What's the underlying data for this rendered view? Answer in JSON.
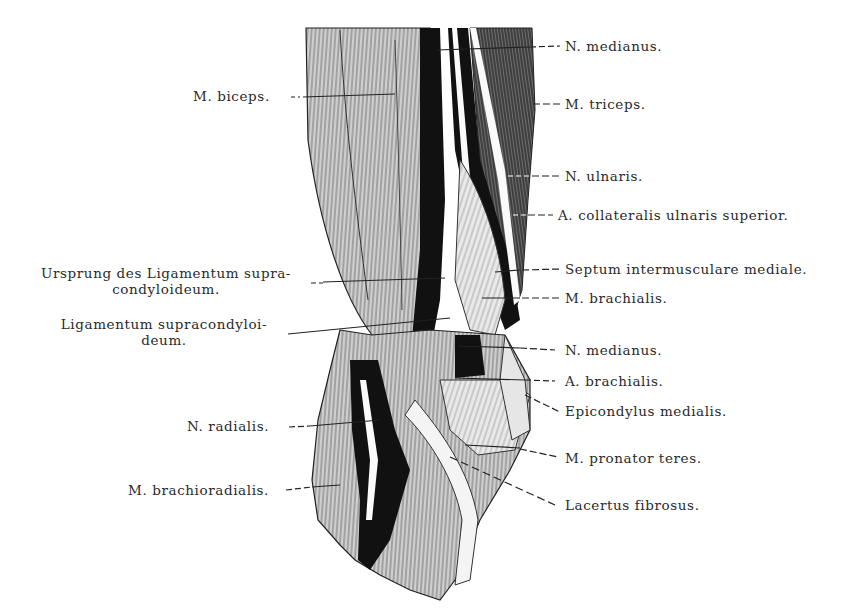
{
  "figure": {
    "colors": {
      "ink": "#111111",
      "paper": "#ffffff",
      "text": "#2a2a2a"
    }
  },
  "labels_left": [
    {
      "id": "biceps",
      "text": "M. biceps.",
      "x": 193,
      "y": 87
    },
    {
      "id": "ursprung",
      "line1": "Ursprung des Ligamentum supra-",
      "line2": "condyloideum.",
      "x": 26,
      "y": 265
    },
    {
      "id": "ligamentum",
      "line1": "Ligamentum supracondyloi-",
      "line2": "deum.",
      "x": 52,
      "y": 316
    },
    {
      "id": "radialis",
      "text": "N. radialis.",
      "x": 187,
      "y": 418
    },
    {
      "id": "brachioradialis",
      "text": "M. brachioradialis.",
      "x": 128,
      "y": 482
    }
  ],
  "labels_right": [
    {
      "id": "medianus-top",
      "text": "N. medianus.",
      "x": 565,
      "y": 37
    },
    {
      "id": "triceps",
      "text": "M. triceps.",
      "x": 565,
      "y": 96
    },
    {
      "id": "ulnaris",
      "text": "N. ulnaris.",
      "x": 565,
      "y": 167
    },
    {
      "id": "collateralis",
      "text": "A. collateralis ulnaris superior.",
      "x": 558,
      "y": 208
    },
    {
      "id": "septum",
      "text": "Septum intermusculare mediale.",
      "x": 565,
      "y": 261
    },
    {
      "id": "brachialis-m",
      "text": "M. brachialis.",
      "x": 565,
      "y": 290
    },
    {
      "id": "medianus-low",
      "text": "N. medianus.",
      "x": 565,
      "y": 343
    },
    {
      "id": "brachialis-a",
      "text": "A. brachialis.",
      "x": 565,
      "y": 374
    },
    {
      "id": "epicondylus",
      "text": "Epicondylus medialis.",
      "x": 565,
      "y": 403
    },
    {
      "id": "pronator",
      "text": "M. pronator teres.",
      "x": 565,
      "y": 450
    },
    {
      "id": "lacertus",
      "text": "Lacertus fibrosus.",
      "x": 565,
      "y": 498
    }
  ]
}
